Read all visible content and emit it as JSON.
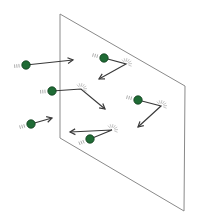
{
  "diagram": {
    "colors": {
      "background": "#ffffff",
      "plane_edge": "#8a8a8a",
      "particle_fill": "#1f6b35",
      "particle_stroke": "#0f3d1c",
      "arrow": "#3a3a3a",
      "motion_lines": "#9a9a9a",
      "burst": "#b0b0b0"
    },
    "plane": {
      "points": [
        [
          60,
          14
        ],
        [
          185,
          86
        ],
        [
          184,
          211
        ],
        [
          60,
          138
        ]
      ]
    },
    "particles": [
      {
        "id": "p1",
        "ball": [
          26,
          65
        ],
        "collides": false,
        "path": [
          [
            26,
            65
          ],
          [
            73,
            60
          ]
        ]
      },
      {
        "id": "p2",
        "ball": [
          104,
          58
        ],
        "collides": true,
        "path": [
          [
            104,
            58
          ],
          [
            126,
            64
          ],
          [
            99,
            79
          ]
        ]
      },
      {
        "id": "p3",
        "ball": [
          52,
          91
        ],
        "collides": true,
        "path": [
          [
            52,
            91
          ],
          [
            81,
            89
          ],
          [
            105,
            109
          ]
        ]
      },
      {
        "id": "p4",
        "ball": [
          138,
          100
        ],
        "collides": true,
        "path": [
          [
            138,
            100
          ],
          [
            161,
            106
          ],
          [
            138,
            127
          ]
        ]
      },
      {
        "id": "p5",
        "ball": [
          31,
          124
        ],
        "collides": false,
        "path": [
          [
            31,
            124
          ],
          [
            52,
            118
          ]
        ]
      },
      {
        "id": "p6",
        "ball": [
          90,
          139
        ],
        "collides": true,
        "path": [
          [
            90,
            139
          ],
          [
            112,
            130
          ],
          [
            70,
            132
          ]
        ]
      }
    ]
  }
}
